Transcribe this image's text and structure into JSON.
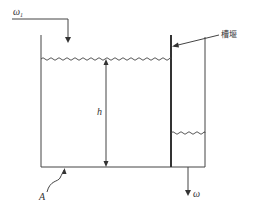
{
  "diagram": {
    "type": "tank-with-weir",
    "labels": {
      "inflow": "ω",
      "inflow_subscript": "1",
      "weir": "槽堰",
      "height": "h",
      "area": "A",
      "outflow": "ω"
    },
    "colors": {
      "line": "#444444",
      "background": "#ffffff"
    }
  }
}
